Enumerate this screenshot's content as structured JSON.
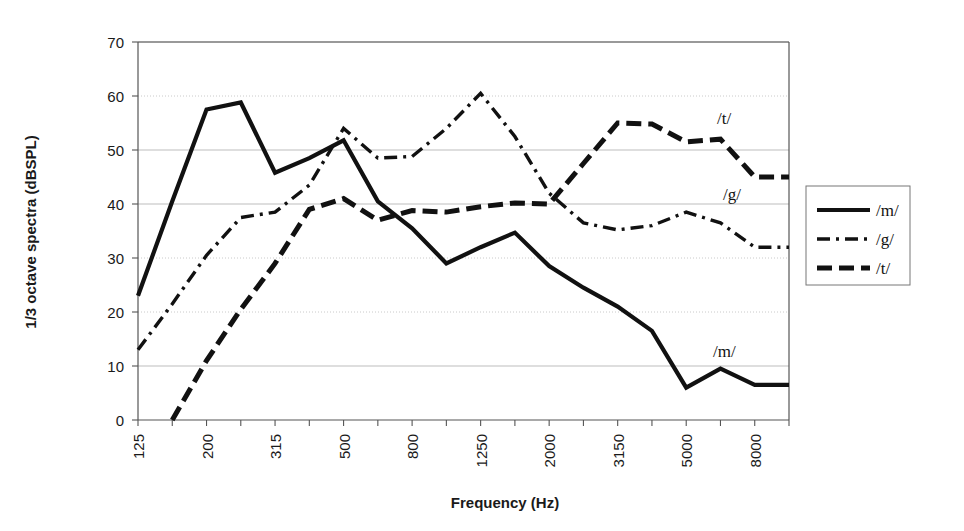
{
  "chart_data": {
    "type": "line",
    "title": "",
    "xlabel": "Frequency (Hz)",
    "ylabel": "1/3 octave spectra (dBSPL)",
    "ylim": [
      0,
      70
    ],
    "yticks": [
      0,
      10,
      20,
      30,
      40,
      50,
      60,
      70
    ],
    "grid": true,
    "legend_position": "right-outside",
    "x_tick_labels": [
      "125",
      "",
      "200",
      "",
      "315",
      "",
      "500",
      "",
      "800",
      "",
      "1250",
      "",
      "2000",
      "",
      "3150",
      "",
      "5000",
      "",
      "8000",
      ""
    ],
    "categories": [
      "125",
      "160",
      "200",
      "250",
      "315",
      "400",
      "500",
      "630",
      "800",
      "1000",
      "1250",
      "1600",
      "2000",
      "2500",
      "3150",
      "4000",
      "5000",
      "6300",
      "8000",
      "10000"
    ],
    "series": [
      {
        "name": "/m/",
        "style": "solid",
        "values": [
          23,
          40.5,
          57.5,
          58.8,
          45.8,
          48.5,
          51.8,
          40.5,
          35.5,
          29,
          32,
          34.7,
          28.5,
          24.5,
          21,
          16.5,
          6,
          9.5,
          6.5,
          6.5
        ]
      },
      {
        "name": "/g/",
        "style": "dash-dot",
        "values": [
          13,
          21.5,
          30.5,
          37.5,
          38.5,
          43.5,
          54,
          48.5,
          48.8,
          54,
          60.5,
          52.5,
          42,
          36.5,
          35.2,
          36,
          38.5,
          36.5,
          32,
          32
        ]
      },
      {
        "name": "/t/",
        "style": "dashed",
        "values": [
          null,
          0,
          11,
          20.5,
          29,
          39,
          41,
          37,
          38.8,
          38.5,
          39.5,
          40.2,
          40,
          47.5,
          55,
          54.8,
          51.5,
          52,
          45,
          45
        ]
      }
    ],
    "annotations": [
      {
        "text": "/t/",
        "series": "/t/"
      },
      {
        "text": "/g/",
        "series": "/g/"
      },
      {
        "text": "/m/",
        "series": "/m/"
      }
    ],
    "legend_entries": [
      {
        "label": "/m/",
        "style": "solid"
      },
      {
        "label": "/g/",
        "style": "dash-dot"
      },
      {
        "label": "/t/",
        "style": "dashed"
      }
    ]
  }
}
